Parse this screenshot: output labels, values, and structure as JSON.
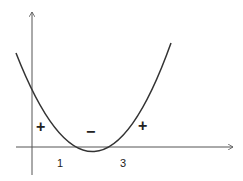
{
  "diagram": {
    "roots": [
      "1",
      "3"
    ],
    "signs": [
      "+",
      "−",
      "+"
    ],
    "colors": {
      "stroke": "#333333",
      "background": "#ffffff"
    }
  }
}
